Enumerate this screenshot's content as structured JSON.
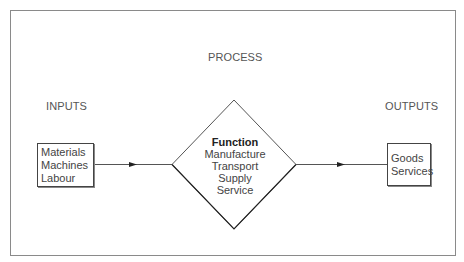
{
  "diagram": {
    "title": "PROCESS",
    "inputs": {
      "heading": "INPUTS",
      "items": [
        "Materials",
        "Machines",
        "Labour"
      ]
    },
    "function": {
      "heading": "Function",
      "items": [
        "Manufacture",
        "Transport",
        "Supply",
        "Service"
      ]
    },
    "outputs": {
      "heading": "OUTPUTS",
      "items": [
        "Goods",
        "Services"
      ]
    }
  },
  "colors": {
    "background": "#ffffff",
    "frame": "#8a8a8a",
    "lines": "#444444",
    "text": "#444444"
  }
}
